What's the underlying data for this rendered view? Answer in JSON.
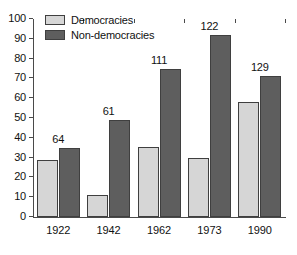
{
  "chart_data": {
    "type": "bar",
    "title": "",
    "subtitle": "",
    "xlabel": "",
    "ylabel": "",
    "categories": [
      "1922",
      "1942",
      "1962",
      "1973",
      "1990"
    ],
    "series": [
      {
        "name": "Democracies",
        "color": "#d6d6d6",
        "values": [
          29,
          11,
          35.5,
          30,
          58
        ]
      },
      {
        "name": "Non-democracies",
        "color": "#5e5e5e",
        "values": [
          35,
          49,
          75,
          92,
          71
        ]
      }
    ],
    "group_totals": [
      64,
      61,
      111,
      122,
      129
    ],
    "group_total_labels": [
      "64",
      "61",
      "111",
      "122",
      "129"
    ],
    "ylim": [
      0,
      100
    ],
    "ytick_values": [
      0,
      10,
      20,
      30,
      40,
      50,
      60,
      70,
      80,
      90,
      100
    ],
    "ytick_labels": [
      "0",
      "10",
      "20",
      "30",
      "40",
      "50",
      "60",
      "70",
      "80",
      "90",
      "100"
    ],
    "grid": false,
    "legend_position": "top-left",
    "legend_entries": [
      "Democracies",
      "Non-democracies"
    ]
  },
  "legend": {
    "democracies_label": "Democracies",
    "nondemocracies_label": "Non-democracies"
  }
}
